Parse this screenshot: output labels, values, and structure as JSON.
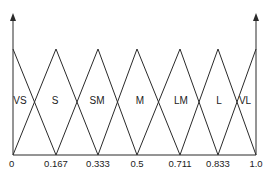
{
  "diagram": {
    "type": "fuzzy-membership-functions",
    "shape": "triangular",
    "x_ticks": [
      {
        "label": "0",
        "value": 0,
        "px": 13
      },
      {
        "label": "0.167",
        "value": 0.167,
        "px": 56
      },
      {
        "label": "0.333",
        "value": 0.333,
        "px": 98
      },
      {
        "label": "0.5",
        "value": 0.5,
        "px": 137
      },
      {
        "label": "0.711",
        "value": 0.711,
        "px": 180
      },
      {
        "label": "0.833",
        "value": 0.833,
        "px": 218
      },
      {
        "label": "1.0",
        "value": 1.0,
        "px": 256
      }
    ],
    "sets": [
      {
        "label": "VS",
        "peak": 0,
        "px": 13,
        "label_x": 20
      },
      {
        "label": "S",
        "peak": 0.167,
        "px": 56,
        "label_x": 55
      },
      {
        "label": "SM",
        "peak": 0.333,
        "px": 98,
        "label_x": 97
      },
      {
        "label": "M",
        "peak": 0.5,
        "px": 137,
        "label_x": 140
      },
      {
        "label": "LM",
        "peak": 0.711,
        "px": 180,
        "label_x": 181
      },
      {
        "label": "L",
        "peak": 0.833,
        "px": 218,
        "label_x": 219
      },
      {
        "label": "VL",
        "peak": 1.0,
        "px": 256,
        "label_x": 245
      }
    ],
    "colors": {
      "line": "#2a2a2a",
      "background": "#ffffff"
    }
  }
}
